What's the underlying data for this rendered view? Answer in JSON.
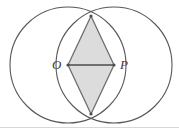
{
  "figure": {
    "width": 179,
    "height": 129,
    "background_color": "#ffffff",
    "stroke_color": "#58585a",
    "shade_fill": "#dcdcdc",
    "shade_stroke": "#6e6e70",
    "border_color": "#d8d8d8",
    "labels": {
      "center_left": "O",
      "center_right": "P"
    },
    "circles": [
      {
        "name": "circle-left",
        "cx": 68,
        "cy": 65,
        "r": 58
      },
      {
        "name": "circle-right",
        "cx": 114,
        "cy": 65,
        "r": 58
      }
    ],
    "points": [
      {
        "name": "O",
        "x": 68,
        "y": 65,
        "marked": true
      },
      {
        "name": "P",
        "x": 114,
        "y": 65,
        "marked": true
      },
      {
        "name": "top-intersection",
        "x": 91,
        "y": 16,
        "marked": true
      },
      {
        "name": "bottom-intersection",
        "x": 91,
        "y": 114,
        "marked": true
      }
    ],
    "segments": [
      {
        "name": "segment-OP",
        "from": "O",
        "to": "P"
      },
      {
        "name": "segment-O-top",
        "from": "O",
        "to": "top-intersection"
      },
      {
        "name": "segment-P-top",
        "from": "P",
        "to": "top-intersection"
      },
      {
        "name": "segment-O-bottom",
        "from": "O",
        "to": "bottom-intersection"
      },
      {
        "name": "segment-P-bottom",
        "from": "P",
        "to": "bottom-intersection"
      }
    ],
    "shaded_polygon": {
      "name": "rhombus-O-top-P-bottom",
      "vertices": [
        "O",
        "top-intersection",
        "P",
        "bottom-intersection"
      ]
    }
  }
}
